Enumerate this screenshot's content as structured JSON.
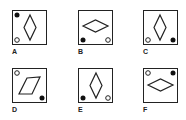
{
  "puzzle": {
    "options": [
      {
        "label": "A",
        "x": 12,
        "y": 10,
        "shape": "diamond-vertical",
        "filled_dot": "top-left",
        "hollow_dot": "bottom-left"
      },
      {
        "label": "B",
        "x": 78,
        "y": 10,
        "shape": "diamond-horizontal",
        "filled_dot": "bottom-left",
        "hollow_dot": "bottom-right"
      },
      {
        "label": "C",
        "x": 143,
        "y": 10,
        "shape": "diamond-vertical",
        "filled_dot": "bottom-right",
        "hollow_dot": "bottom-left"
      },
      {
        "label": "D",
        "x": 12,
        "y": 68,
        "shape": "parallelogram-slanted",
        "filled_dot": "bottom-right",
        "hollow_dot": "top-left"
      },
      {
        "label": "E",
        "x": 78,
        "y": 68,
        "shape": "diamond-vertical",
        "filled_dot": "bottom-left",
        "hollow_dot": "bottom-right"
      },
      {
        "label": "F",
        "x": 143,
        "y": 68,
        "shape": "diamond-horizontal",
        "filled_dot": "top-right",
        "hollow_dot": "top-left"
      }
    ]
  }
}
